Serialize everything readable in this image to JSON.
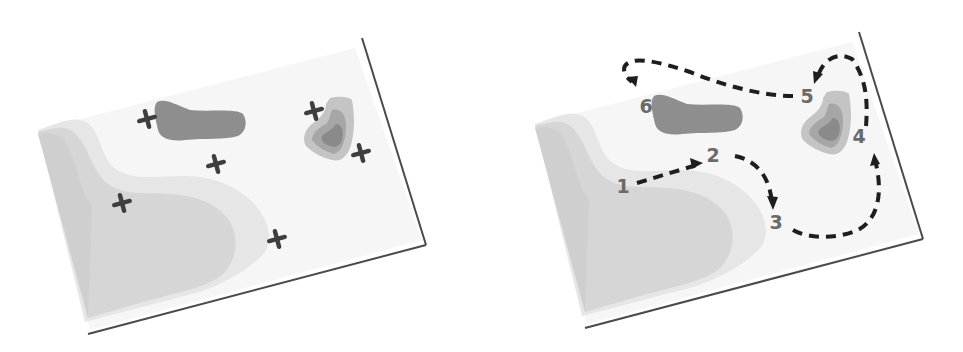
{
  "colors": {
    "paper": "#f6f6f6",
    "paper_edge": "#4a4a4a",
    "shallow": "#ececec",
    "mid": "#dadada",
    "deep": "#c6c6c6",
    "blob_dark": "#8e8e8e",
    "heart_outer": "#c2c2c2",
    "heart_mid": "#a8a8a8",
    "heart_inner": "#8a8a8a",
    "marker": "#3e3e3e",
    "route": "#1e1e1e",
    "label": "#6a6a6a"
  },
  "left_map": {
    "title": "candidate locations",
    "markers": [
      {
        "id": "x1",
        "x": 147,
        "y": 119
      },
      {
        "id": "x2",
        "x": 216,
        "y": 164
      },
      {
        "id": "x3",
        "x": 122,
        "y": 203
      },
      {
        "id": "x4",
        "x": 277,
        "y": 239
      },
      {
        "id": "x5",
        "x": 314,
        "y": 111
      },
      {
        "id": "x6",
        "x": 361,
        "y": 153
      }
    ]
  },
  "right_map": {
    "title": "visiting route",
    "stops": [
      {
        "label": "1",
        "x": 623,
        "y": 193
      },
      {
        "label": "2",
        "x": 713,
        "y": 162
      },
      {
        "label": "3",
        "x": 776,
        "y": 229
      },
      {
        "label": "4",
        "x": 859,
        "y": 143
      },
      {
        "label": "5",
        "x": 807,
        "y": 103
      },
      {
        "label": "6",
        "x": 646,
        "y": 113
      }
    ]
  }
}
